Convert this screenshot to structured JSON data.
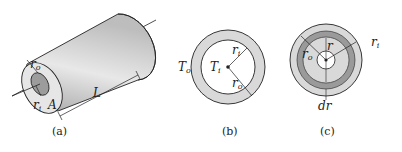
{
  "figure": {
    "panels": [
      {
        "id": "a",
        "caption": "(a)",
        "description": "Hollow cylinder (pipe) of length L",
        "labels": {
          "outer_radius": "r",
          "outer_radius_sub": "o",
          "inner_radius": "r",
          "inner_radius_sub": "i",
          "area": "A",
          "length": "L"
        }
      },
      {
        "id": "b",
        "caption": "(b)",
        "description": "Cross-section with inner and outer temperatures",
        "labels": {
          "outer_temp": "T",
          "outer_temp_sub": "o",
          "inner_temp": "T",
          "inner_temp_sub": "i",
          "inner_radius": "r",
          "inner_radius_sub": "i",
          "outer_radius": "r",
          "outer_radius_sub": "o"
        }
      },
      {
        "id": "c",
        "caption": "(c)",
        "description": "Cross-section with thin annular element of thickness dr at radius r",
        "labels": {
          "outer_radius": "r",
          "outer_radius_sub": "o",
          "radius": "r",
          "inner_radius": "r",
          "inner_radius_sub": "i",
          "thickness": "dr"
        }
      }
    ],
    "colors": {
      "ring_light": "#d9d9d9",
      "ring_dark": "#9a9a9a",
      "stroke": "#222222",
      "cylinder_face": "#e6e6e6"
    }
  }
}
